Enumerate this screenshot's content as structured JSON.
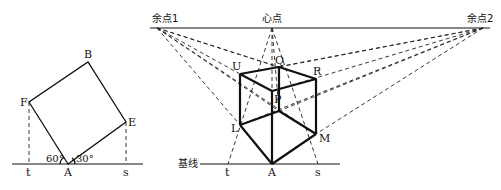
{
  "left_figure": {
    "points": {
      "A": {
        "label": "A",
        "x": 68,
        "y": 164
      },
      "B": {
        "label": "B",
        "x": 88,
        "y": 62
      },
      "E": {
        "label": "E",
        "x": 126,
        "y": 122
      },
      "F": {
        "label": "F",
        "x": 29,
        "y": 102
      },
      "t": {
        "label": "t",
        "x": 29,
        "y": 164
      },
      "s": {
        "label": "s",
        "x": 126,
        "y": 164
      }
    },
    "angles": {
      "left": "60°",
      "right": "30°"
    }
  },
  "right_figure": {
    "horizon": {
      "vp1_label": "余点1",
      "center_label": "心点",
      "vp2_label": "余点2"
    },
    "baseline_label": "基线",
    "points": {
      "U": "U",
      "Q": "Q",
      "R": "R",
      "P": "P",
      "L": "L",
      "M": "M",
      "A": "A",
      "t": "t",
      "s": "s"
    }
  },
  "colors": {
    "line": "#111111",
    "background": "#ffffff"
  }
}
